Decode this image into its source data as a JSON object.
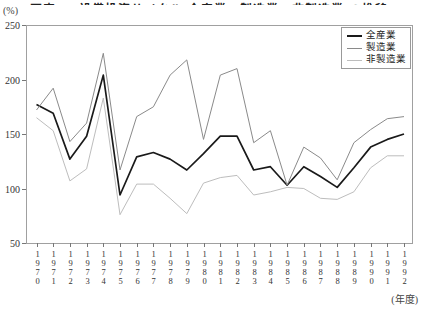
{
  "page": {
    "clipped_title": "図表2-6 設備投資サイクル(全産業・製造業・非製造業)の推移",
    "percent_label": "(%)",
    "fiscal_year_label": "(年度)"
  },
  "legend": {
    "position": "top-right",
    "items": [
      {
        "label": "全産業",
        "color": "#1a1a1a",
        "weight": 2
      },
      {
        "label": "製造業",
        "color": "#8a8a8a",
        "weight": 1
      },
      {
        "label": "非製造業",
        "color": "#bdbdbd",
        "weight": 1
      }
    ]
  },
  "chart_data": {
    "type": "line",
    "title": "図表2-6 設備投資サイクル(全産業・製造業・非製造業)の推移",
    "xlabel": "(年度)",
    "ylabel": "(%)",
    "x": [
      1970,
      1971,
      1972,
      1973,
      1974,
      1975,
      1976,
      1977,
      1978,
      1979,
      1980,
      1981,
      1982,
      1983,
      1984,
      1985,
      1986,
      1987,
      1988,
      1989,
      1990,
      1991,
      1992
    ],
    "ylim": [
      50,
      250
    ],
    "yticks": [
      50,
      100,
      150,
      200,
      250
    ],
    "grid": false,
    "legend_position": "top-right",
    "frame_color": "#a0a0a0",
    "series": [
      {
        "name": "全産業",
        "color": "#1a1a1a",
        "width": 1.7,
        "values": [
          177,
          169,
          127,
          148,
          204,
          94,
          129,
          133,
          127,
          117,
          132,
          148,
          148,
          117,
          120,
          103,
          120,
          111,
          101,
          119,
          138,
          145,
          150
        ]
      },
      {
        "name": "製造業",
        "color": "#8a8a8a",
        "width": 1,
        "values": [
          172,
          192,
          143,
          160,
          224,
          117,
          166,
          175,
          204,
          218,
          145,
          204,
          210,
          142,
          153,
          103,
          138,
          128,
          108,
          142,
          154,
          164,
          166
        ]
      },
      {
        "name": "非製造業",
        "color": "#bdbdbd",
        "width": 1,
        "values": [
          165,
          153,
          107,
          118,
          183,
          76,
          104,
          104,
          91,
          77,
          105,
          110,
          112,
          94,
          97,
          101,
          100,
          91,
          90,
          97,
          119,
          130,
          130
        ]
      }
    ]
  }
}
